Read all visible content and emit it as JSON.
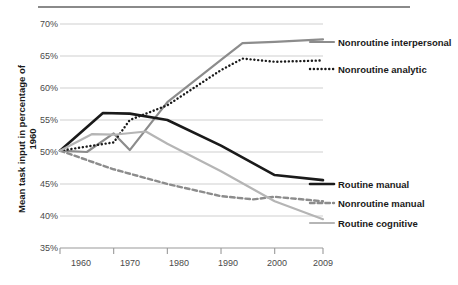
{
  "chart_data": {
    "type": "line",
    "title": "",
    "xlabel": "",
    "ylabel": "Mean task input in percentage of 1960",
    "x": [
      1960,
      1970,
      1980,
      1990,
      2000,
      2009
    ],
    "xlim": [
      1960,
      2009
    ],
    "ylim": [
      35,
      70
    ],
    "yticks": [
      "35%",
      "40%",
      "45%",
      "50%",
      "55%",
      "60%",
      "65%",
      "70%"
    ],
    "ytick_values": [
      35,
      40,
      45,
      50,
      55,
      60,
      65,
      70
    ],
    "xticks": [
      "1960",
      "1970",
      "1980",
      "1990",
      "2000",
      "2009"
    ],
    "grid": true,
    "legend_position": "right",
    "series": [
      {
        "name": "Nonroutine interpersonal",
        "style": "solid",
        "color": "#8c8c8c",
        "width": 2.2,
        "x": [
          1960,
          1965,
          1970,
          1973,
          1980,
          1990,
          1994,
          2000,
          2009
        ],
        "values": [
          50.2,
          50.0,
          52.9,
          50.3,
          57.8,
          64.4,
          67.0,
          67.2,
          67.6
        ]
      },
      {
        "name": "Nonroutine analytic",
        "style": "dotted",
        "color": "#1a1a1a",
        "width": 2.4,
        "x": [
          1960,
          1970,
          1973,
          1980,
          1990,
          1994,
          2000,
          2009
        ],
        "values": [
          50.2,
          51.5,
          55.0,
          57.3,
          62.8,
          64.6,
          64.1,
          64.3
        ]
      },
      {
        "name": "Routine manual",
        "style": "solid",
        "color": "#1a1a1a",
        "width": 2.6,
        "x": [
          1960,
          1968,
          1973,
          1980,
          1990,
          2000,
          2009
        ],
        "values": [
          50.2,
          56.1,
          56.0,
          55.0,
          51.0,
          46.4,
          45.6
        ]
      },
      {
        "name": "Nonroutine manual",
        "style": "dashed",
        "color": "#8c8c8c",
        "width": 2.4,
        "x": [
          1960,
          1970,
          1980,
          1990,
          1996,
          2000,
          2009
        ],
        "values": [
          50.2,
          47.3,
          45.0,
          43.1,
          42.6,
          43.0,
          42.3
        ]
      },
      {
        "name": "Routine cognitive",
        "style": "solid",
        "color": "#b5b5b5",
        "width": 2.2,
        "x": [
          1960,
          1966,
          1970,
          1976,
          1980,
          1990,
          2000,
          2009
        ],
        "values": [
          50.2,
          52.8,
          52.7,
          53.2,
          51.3,
          47.0,
          42.3,
          39.5
        ]
      }
    ],
    "annotations": []
  },
  "axis": {
    "y_title": "Mean task input in percentage of 1960",
    "y_labels": [
      "70%",
      "65%",
      "60%",
      "55%",
      "50%",
      "45%",
      "40%",
      "35%"
    ],
    "x_labels": [
      "1960",
      "1970",
      "1980",
      "1990",
      "2000",
      "2009"
    ]
  },
  "legend": {
    "items": [
      {
        "label": "Nonroutine interpersonal",
        "marker": "solid-gray-line"
      },
      {
        "label": "Nonroutine analytic",
        "marker": "dotted-black-line"
      },
      {
        "label": "Routine manual",
        "marker": "solid-black-line"
      },
      {
        "label": "Nonroutine manual",
        "marker": "dashed-gray-line"
      },
      {
        "label": "Routine cognitive",
        "marker": "solid-lightgray-line"
      }
    ]
  }
}
